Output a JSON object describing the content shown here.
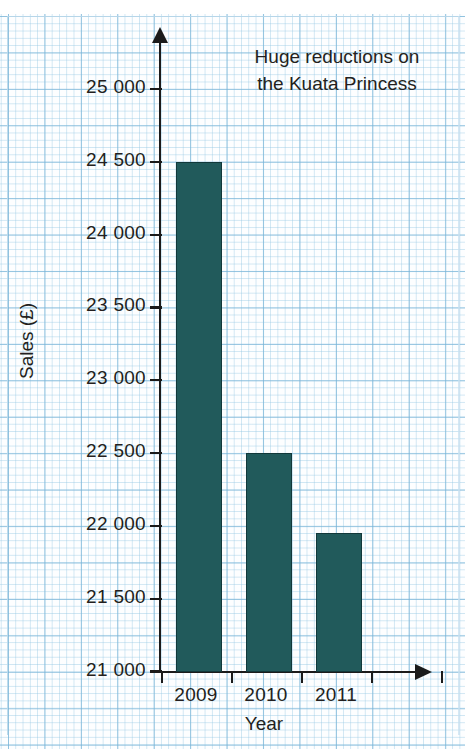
{
  "chart_data": {
    "type": "bar",
    "title": "",
    "xlabel": "Year",
    "ylabel": "Sales (£)",
    "categories": [
      "2009",
      "2010",
      "2011"
    ],
    "values": [
      24500,
      22500,
      21950
    ],
    "ylim": [
      21000,
      25000
    ],
    "ytick_values": [
      21000,
      21500,
      22000,
      22500,
      23000,
      23500,
      24000,
      24500,
      25000
    ],
    "ytick_labels": [
      "21 000",
      "21 500",
      "22 000",
      "22 500",
      "23 000",
      "23 500",
      "24 000",
      "24 500",
      "25 000"
    ],
    "annotations": [
      {
        "line1": "Huge reductions on",
        "line2": "the Kuata Princess"
      }
    ],
    "grid": true,
    "grid_style": "graph-paper-squares",
    "legend": "none",
    "bar_color": "#215a5b",
    "bar_edge_color": "#12383a",
    "axis_color": "#1b1b1b",
    "grid_color": "#78b4d7",
    "background_color": "#fdfeff",
    "axis_arrows": true,
    "xtick_placement": "between-categories"
  },
  "top_cut_text": "",
  "annotation": {
    "line1": "Huge reductions on",
    "line2": "the Kuata Princess"
  },
  "axes": {
    "x_title": "Year",
    "y_title": "Sales (£)"
  }
}
